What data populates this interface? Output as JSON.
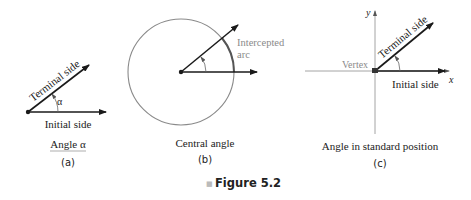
{
  "figure": {
    "caption": "Figure 5.2",
    "caption_bullet": "■",
    "colors": {
      "line": "#1a1a1a",
      "circle": "#8a8a8a",
      "gray_label": "#8a8a8a",
      "axis": "#9a9a9a",
      "caption_bullet": "#bbbbbb",
      "text": "#222222"
    }
  },
  "panels": [
    {
      "id": "a",
      "terminal_label": "Terminal side",
      "initial_label": "Initial side",
      "angle_symbol": "α",
      "title": "Angle α",
      "tag": "(a)"
    },
    {
      "id": "b",
      "arc_label_line1": "Intercepted",
      "arc_label_line2": "arc",
      "title": "Central angle",
      "tag": "(b)"
    },
    {
      "id": "c",
      "y_axis_label": "y",
      "x_axis_label": "x",
      "vertex_label": "Vertex",
      "terminal_label": "Terminal side",
      "initial_label": "Initial side",
      "title": "Angle in standard position",
      "tag": "(c)"
    }
  ]
}
